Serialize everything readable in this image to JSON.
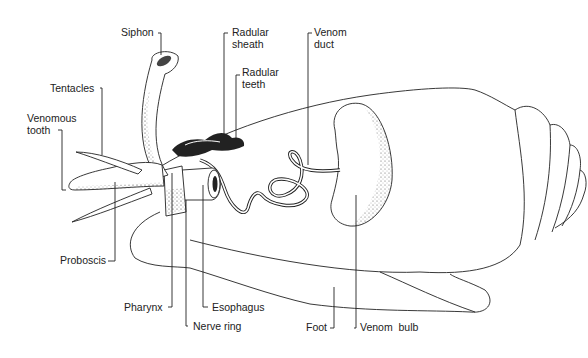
{
  "diagram": {
    "labels": {
      "siphon": "Siphon",
      "radular_sheath_1": "Radular",
      "radular_sheath_2": "sheath",
      "radular_teeth_1": "Radular",
      "radular_teeth_2": "teeth",
      "venom_duct_1": "Venom",
      "venom_duct_2": "duct",
      "tentacles": "Tentacles",
      "venomous_tooth_1": "Venomous",
      "venomous_tooth_2": "tooth",
      "proboscis": "Proboscis",
      "pharynx": "Pharynx",
      "nerve_ring": "Nerve ring",
      "esophagus": "Esophagus",
      "foot": "Foot",
      "venom_bulb": "Venom  bulb"
    }
  }
}
